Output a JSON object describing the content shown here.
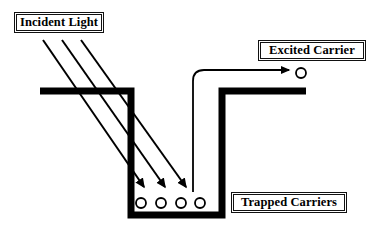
{
  "figure": {
    "type": "schematic-diagram",
    "background_color": "#ffffff",
    "stroke_color": "#000000"
  },
  "labels": {
    "incident_light": "Incident Light",
    "excited_carrier": "Excited Carrier",
    "trapped_carriers": "Trapped Carriers"
  },
  "diagram": {
    "well": {
      "name": "potential-well",
      "line_color": "#000000",
      "line_width": 7,
      "left_band": {
        "x1": 40,
        "y1": 91,
        "x2": 131,
        "y2": 91
      },
      "left_wall": {
        "x1": 131,
        "y1": 88,
        "x2": 131,
        "y2": 215
      },
      "bottom": {
        "x1": 128,
        "y1": 215,
        "x2": 222,
        "y2": 215
      },
      "right_wall": {
        "x1": 221,
        "y1": 215,
        "x2": 221,
        "y2": 91
      },
      "right_band": {
        "x1": 218,
        "y1": 91,
        "x2": 306,
        "y2": 91
      }
    },
    "incident_rays": {
      "name": "incident-light-rays",
      "count": 3,
      "line_width": 2,
      "arrowhead": "filled-triangle",
      "rays": [
        {
          "x1": 43,
          "y1": 40,
          "x2": 144,
          "y2": 187
        },
        {
          "x1": 62,
          "y1": 40,
          "x2": 165,
          "y2": 187
        },
        {
          "x1": 81,
          "y1": 40,
          "x2": 186,
          "y2": 187
        }
      ]
    },
    "trapped_carriers": {
      "name": "trapped-carrier-circles",
      "count": 4,
      "radius": 5,
      "fill": "none",
      "stroke_width": 1.8,
      "centers": [
        {
          "cx": 141,
          "cy": 203
        },
        {
          "cx": 161,
          "cy": 203
        },
        {
          "cx": 181,
          "cy": 203
        },
        {
          "cx": 200,
          "cy": 203
        }
      ]
    },
    "excitation_arrow": {
      "name": "excitation-path-arrow",
      "line_width": 1.8,
      "arrowhead": "filled-triangle",
      "start": {
        "x": 193,
        "y": 192
      },
      "corner": {
        "x": 193,
        "y": 70
      },
      "end": {
        "x": 289,
        "y": 70
      },
      "corner_radius": 11
    },
    "excited_carrier_circle": {
      "name": "excited-carrier-circle",
      "cx": 301,
      "cy": 73,
      "r": 5,
      "fill": "none",
      "stroke_width": 1.8
    }
  }
}
